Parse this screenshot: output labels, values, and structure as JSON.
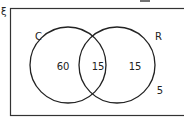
{
  "diagram": {
    "type": "venn",
    "universal_symbol": "ξ",
    "sets": [
      {
        "name": "C",
        "only_count": "60"
      },
      {
        "name": "R",
        "only_count": "15"
      }
    ],
    "intersection_count": "15",
    "outside_count": "5",
    "line_color": "#222222"
  }
}
